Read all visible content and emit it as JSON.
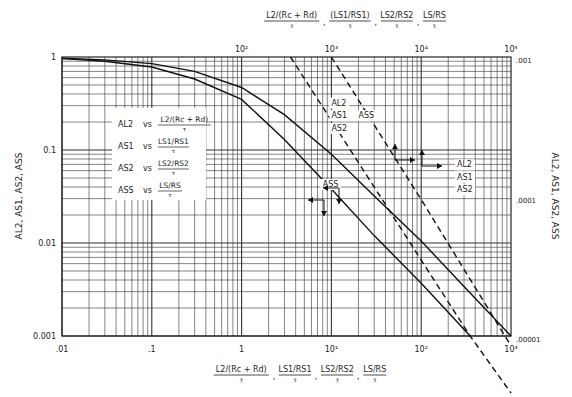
{
  "chart_data": {
    "type": "line",
    "title": "",
    "xscale": "log",
    "yscale": "log",
    "xlim": [
      0.01,
      1000
    ],
    "ylim": [
      0.001,
      1
    ],
    "x2lim": [
      1,
      100000
    ],
    "y2lim": [
      1e-05,
      0.001
    ],
    "grid": true,
    "xlabel": {
      "parts": [
        {
          "num": "L2/(Rc + Rd)",
          "den": "τ"
        },
        {
          "num": "LS1/RS1",
          "den": "τ"
        },
        {
          "num": "LS2/RS2",
          "den": "τ"
        },
        {
          "num": "LS/RS",
          "den": "τ"
        }
      ]
    },
    "x2label": {
      "parts": [
        {
          "num": "L2/(Rc + Rd)",
          "den": "τ"
        },
        {
          "num": "(LS1/RS1)",
          "den": "τ"
        },
        {
          "num": "LS2/RS2",
          "den": "τ"
        },
        {
          "num": "LS/RS",
          "den": "τ"
        }
      ]
    },
    "ylabel": "AL2, AS1, AS2, ASS",
    "y2label": "AL2, AS1, AS2, ASS",
    "xticks": [
      {
        "value": 0.01,
        "label": ".01"
      },
      {
        "value": 0.1,
        "label": ".1"
      },
      {
        "value": 1,
        "label": "1"
      },
      {
        "value": 10,
        "label": "10¹"
      },
      {
        "value": 100,
        "label": "10²"
      },
      {
        "value": 1000,
        "label": "10³"
      }
    ],
    "x2ticks": [
      {
        "value": 100,
        "label": "10²"
      },
      {
        "value": 1000,
        "label": "10³"
      },
      {
        "value": 10000,
        "label": "10⁴"
      },
      {
        "value": 100000,
        "label": "10⁵"
      }
    ],
    "yticks": [
      {
        "value": 1,
        "label": "1"
      },
      {
        "value": 0.1,
        "label": "0.1"
      },
      {
        "value": 0.01,
        "label": "0.01"
      },
      {
        "value": 0.001,
        "label": "0.001"
      }
    ],
    "y2ticks": [
      {
        "value": 0.001,
        "label": ".001"
      },
      {
        "value": 0.0001,
        "label": ".0001"
      },
      {
        "value": 1e-05,
        "label": ".00001"
      }
    ],
    "legend": {
      "placement": "upper-left-inset",
      "entries": [
        {
          "name": "AL2",
          "vs_num": "L2/(Rc + Rd)",
          "vs_den": "τ"
        },
        {
          "name": "AS1",
          "vs_num": "LS1/RS1",
          "vs_den": "τ"
        },
        {
          "name": "AS2",
          "vs_num": "LS2/RS2",
          "vs_den": "τ"
        },
        {
          "name": "ASS",
          "vs_num": "LS/RS",
          "vs_den": "τ"
        }
      ]
    },
    "series": [
      {
        "name": "AL2, AS1, AS2 (solid, bottom/left axes)",
        "style": "solid",
        "axes": "bottom-left",
        "x": [
          0.01,
          0.03,
          0.1,
          0.3,
          1,
          3,
          10,
          30,
          100,
          300,
          1000
        ],
        "y": [
          0.97,
          0.93,
          0.85,
          0.7,
          0.47,
          0.24,
          0.09,
          0.032,
          0.0105,
          0.0034,
          0.001
        ]
      },
      {
        "name": "ASS (solid, bottom/left axes)",
        "style": "solid",
        "axes": "bottom-left",
        "x": [
          0.01,
          0.03,
          0.1,
          0.3,
          1,
          3,
          10,
          30,
          100,
          200,
          350
        ],
        "y": [
          0.96,
          0.9,
          0.78,
          0.58,
          0.35,
          0.13,
          0.038,
          0.012,
          0.0037,
          0.0018,
          0.001
        ]
      },
      {
        "name": "AL2, AS1, AS2 (dashed, top/right axes)",
        "style": "dashed",
        "axes": "top-right",
        "x": [
          1000,
          10000,
          100000
        ],
        "y": [
          0.001,
          9.5e-05,
          8.5e-06
        ]
      },
      {
        "name": "ASS (dashed, top/right axes)",
        "style": "dashed",
        "axes": "top-right",
        "x": [
          350,
          3500,
          35000,
          100000
        ],
        "y": [
          0.001,
          0.0001,
          1e-05,
          3.9e-06
        ]
      }
    ],
    "annotations": [
      {
        "text": "AL2",
        "near": "upper solid curve",
        "x": 10,
        "y": 0.3
      },
      {
        "text": "AS1",
        "near": "upper solid curve",
        "x": 10,
        "y": 0.22
      },
      {
        "text": "AS2",
        "near": "upper solid curve",
        "x": 10,
        "y": 0.16
      },
      {
        "text": "ASS",
        "near": "upper dashed curve",
        "x": 20,
        "y": 0.22
      },
      {
        "text": "ASS",
        "near": "lower solid curve",
        "x": 8,
        "y": 0.04
      },
      {
        "text": "AL2",
        "near": "dashed curves right",
        "x": 250,
        "y": 0.065
      },
      {
        "text": "AS1",
        "near": "dashed curves right",
        "x": 250,
        "y": 0.048
      },
      {
        "text": "AS2",
        "near": "dashed curves right",
        "x": 250,
        "y": 0.035
      }
    ]
  }
}
